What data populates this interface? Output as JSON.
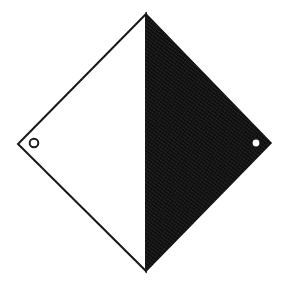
{
  "figure": {
    "canvas": {
      "width": 288,
      "height": 287,
      "background_color": "#ffffff"
    },
    "colors": {
      "background": "#ffffff",
      "fill_dark": "#0d0d0d",
      "fill_light": "#ffffff",
      "outline": "#101010",
      "hole_ring_stroke": "#141414",
      "hole_dot_fill": "#ffffff"
    },
    "outline_width": 2,
    "vertices": {
      "top": {
        "x": 146,
        "y": 14
      },
      "right": {
        "x": 271,
        "y": 143
      },
      "bottom": {
        "x": 146,
        "y": 271
      },
      "left": {
        "x": 18,
        "y": 144
      }
    },
    "divider": {
      "label": "vertical-split-line",
      "from": {
        "x": 146,
        "y": 14
      },
      "to": {
        "x": 146,
        "y": 271
      }
    },
    "halves": [
      {
        "name": "left-half",
        "fill": "#ffffff",
        "stroke": "#101010"
      },
      {
        "name": "right-half",
        "fill": "#0d0d0d",
        "stroke": "#0d0d0d"
      }
    ],
    "holes": [
      {
        "name": "left-hole",
        "style": "ring",
        "cx": 34,
        "cy": 143,
        "r": 4.3,
        "stroke_width": 2,
        "fill": "#ffffff",
        "stroke": "#141414"
      },
      {
        "name": "right-hole",
        "style": "dot",
        "cx": 256,
        "cy": 143,
        "r": 3.4,
        "fill": "#ffffff",
        "stroke": "none"
      }
    ]
  }
}
